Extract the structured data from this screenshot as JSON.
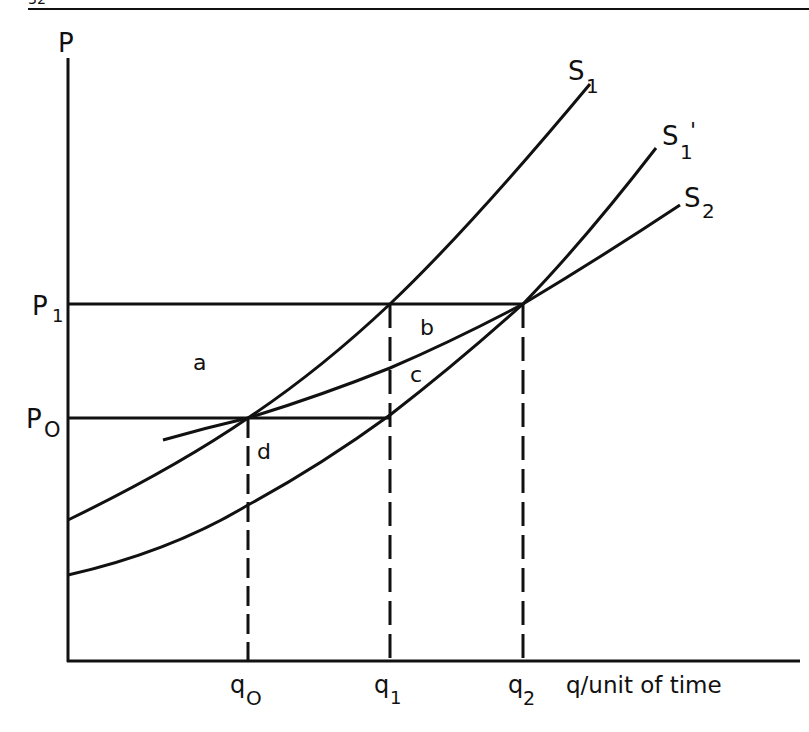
{
  "page": {
    "page_number_fragment": "32"
  },
  "diagram": {
    "title": "",
    "ink_color": "#111111",
    "background_color": "#ffffff",
    "axes": {
      "y_label": "P",
      "x_label": "q/unit of time"
    },
    "price_levels": [
      {
        "label": "P",
        "subscript": "1",
        "id": "P1"
      },
      {
        "label": "P",
        "subscript": "O",
        "id": "P0"
      }
    ],
    "quantity_levels": [
      {
        "label": "q",
        "subscript": "O",
        "id": "q0"
      },
      {
        "label": "q",
        "subscript": "1",
        "id": "q1"
      },
      {
        "label": "q",
        "subscript": "2",
        "id": "q2"
      }
    ],
    "curves": [
      {
        "label": "S",
        "subscript": "1",
        "prime": "",
        "id": "S1"
      },
      {
        "label": "S",
        "subscript": "1",
        "prime": "'",
        "id": "S1prime"
      },
      {
        "label": "S",
        "subscript": "2",
        "prime": "",
        "id": "S2"
      }
    ],
    "regions": [
      {
        "label": "a",
        "id": "area-a"
      },
      {
        "label": "b",
        "id": "area-b"
      },
      {
        "label": "c",
        "id": "area-c"
      },
      {
        "label": "d",
        "id": "area-d"
      }
    ]
  }
}
